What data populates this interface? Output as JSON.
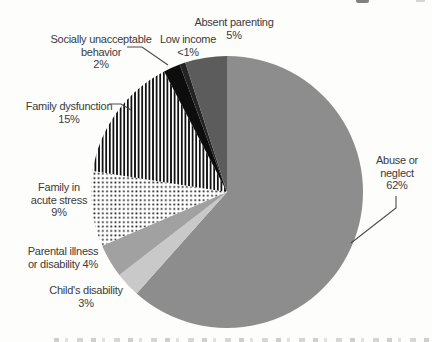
{
  "figure": {
    "background_color": "#fdfdfc",
    "text_color": "#3b3b3b",
    "leader_line_color": "#4a4a4a"
  },
  "chart_data": {
    "type": "pie",
    "title": "",
    "unit": "percent",
    "legend_position": "none",
    "layout": {
      "center_x": 227,
      "center_y": 192,
      "radius": 136,
      "start_angle_deg": 0,
      "direction": "clockwise"
    },
    "slices": [
      {
        "id": "abuse-or-neglect",
        "label": "Abuse or neglect",
        "value": 62,
        "display": "62%",
        "pattern": "solid",
        "fill": "#8d8d8d"
      },
      {
        "id": "childs-disability",
        "label": "Child's disability",
        "value": 3,
        "display": "3%",
        "pattern": "solid",
        "fill": "#c9c9c9"
      },
      {
        "id": "parental-illness-or-disability",
        "label": "Parental illness or disability",
        "value": 4,
        "display": "4%",
        "pattern": "solid",
        "fill": "#a1a1a1"
      },
      {
        "id": "family-in-acute-stress",
        "label": "Family in acute stress",
        "value": 9,
        "display": "9%",
        "pattern": "dots",
        "fill": "#ffffff"
      },
      {
        "id": "family-dysfunction",
        "label": "Family dysfunction",
        "value": 15,
        "display": "15%",
        "pattern": "vertical-stripes",
        "fill": "#ffffff"
      },
      {
        "id": "socially-unacceptable-behavior",
        "label": "Socially unacceptable behavior",
        "value": 2,
        "display": "2%",
        "pattern": "solid",
        "fill": "#0d0d0d"
      },
      {
        "id": "low-income",
        "label": "Low income",
        "value": 0.7,
        "display": "<1%",
        "pattern": "solid",
        "fill": "#242424"
      },
      {
        "id": "absent-parenting",
        "label": "Absent parenting",
        "value": 5,
        "display": "5%",
        "pattern": "solid",
        "fill": "#5c5c5c"
      }
    ],
    "callouts": {
      "absent": {
        "lines": [
          "Absent parenting",
          "5%"
        ]
      },
      "low": {
        "lines": [
          "Low income",
          "<1%"
        ]
      },
      "socially": {
        "lines": [
          "Socially unacceptable",
          "behavior",
          "2%"
        ]
      },
      "dysfunction": {
        "lines": [
          "Family dysfunction",
          "15%"
        ]
      },
      "acute": {
        "lines": [
          "Family in",
          "acute stress",
          "9%"
        ]
      },
      "parental": {
        "lines": [
          "Parental illness",
          "or disability 4%"
        ]
      },
      "child": {
        "lines": [
          "Child's disability",
          "3%"
        ]
      },
      "abuse": {
        "lines": [
          "Abuse or",
          "neglect",
          "62%"
        ]
      }
    },
    "leader_lines": [
      {
        "for": "socially-unacceptable-behavior",
        "points": [
          [
            127,
            47
          ],
          [
            142,
            47
          ],
          [
            168,
            65
          ]
        ]
      },
      {
        "for": "family-dysfunction",
        "points": [
          [
            109,
            104
          ],
          [
            121,
            104
          ],
          [
            131,
            110
          ]
        ]
      },
      {
        "for": "abuse-or-neglect",
        "points": [
          [
            396,
            196
          ],
          [
            396,
            208
          ],
          [
            351,
            243
          ]
        ]
      }
    ]
  }
}
